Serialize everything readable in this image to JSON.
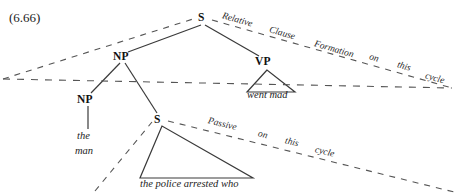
{
  "figure": {
    "example_number": "(6.66)",
    "type": "syntactic-tree-diagram"
  },
  "tree": {
    "nodes": [
      {
        "id": "s-top",
        "label": "S",
        "x": 203,
        "y": 18
      },
      {
        "id": "np-upper",
        "label": "NP",
        "x": 122,
        "y": 57
      },
      {
        "id": "vp",
        "label": "VP",
        "x": 264,
        "y": 62
      },
      {
        "id": "np-lower",
        "label": "NP",
        "x": 86,
        "y": 100
      },
      {
        "id": "s-lower",
        "label": "S",
        "x": 159,
        "y": 120
      }
    ],
    "terminals": [
      {
        "id": "the-man",
        "line1": "the",
        "line2": "man",
        "x": 84,
        "y": 136
      },
      {
        "id": "went-mad",
        "text": "went mad",
        "x": 265,
        "y": 95
      },
      {
        "id": "the-police-arrested-who",
        "text": "the police arrested who",
        "x": 143,
        "y": 183
      }
    ]
  },
  "rules": {
    "relative_clause": {
      "id": "relative-clause-formation-rule",
      "full_text": "Relative Clause Formation on this cycle",
      "words": [
        {
          "text": "Relative",
          "x": 221,
          "y": 18
        },
        {
          "text": "Clause",
          "x": 268,
          "y": 31
        },
        {
          "text": "Formation",
          "x": 315,
          "y": 45
        },
        {
          "text": "on",
          "x": 369,
          "y": 57
        },
        {
          "text": "this",
          "x": 397,
          "y": 65
        },
        {
          "text": "cycle",
          "x": 426,
          "y": 76
        }
      ]
    },
    "passive": {
      "id": "passive-rule",
      "full_text": "Passive on this cycle",
      "words": [
        {
          "text": "Passive",
          "x": 207,
          "y": 122
        },
        {
          "text": "on",
          "x": 258,
          "y": 135
        },
        {
          "text": "this",
          "x": 285,
          "y": 142
        },
        {
          "text": "cycle",
          "x": 316,
          "y": 150
        }
      ]
    }
  },
  "colors": {
    "ink": "#1a1a1a",
    "line": "#3a3a3a",
    "dashed": "#555555",
    "background": "#ffffff"
  }
}
